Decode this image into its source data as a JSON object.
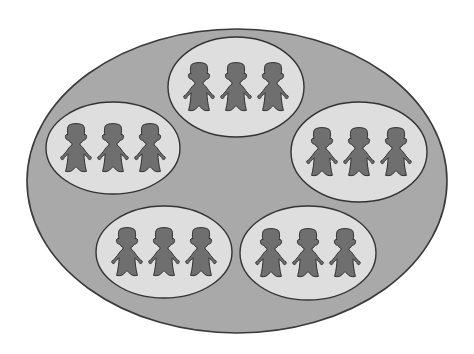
{
  "diagram": {
    "colors": {
      "background": "#ffffff",
      "outer_fill": "#a9a9a9",
      "outer_stroke": "#3a3a3a",
      "group_fill": "#dedede",
      "group_stroke": "#333333",
      "figure_fill": "#6f6f6f",
      "figure_stroke": "#2e2e2e"
    },
    "outer_ellipse": {
      "cx": 237,
      "cy": 181,
      "rx": 210,
      "ry": 152
    },
    "groups": [
      {
        "name": "top",
        "cx": 236,
        "cy": 87,
        "rx": 68,
        "ry": 50,
        "figures": 3
      },
      {
        "name": "left",
        "cx": 113,
        "cy": 148,
        "rx": 67,
        "ry": 46,
        "figures": 3
      },
      {
        "name": "right",
        "cx": 359,
        "cy": 152,
        "rx": 68,
        "ry": 50,
        "figures": 3
      },
      {
        "name": "bottom-left",
        "cx": 164,
        "cy": 252,
        "rx": 68,
        "ry": 46,
        "figures": 3
      },
      {
        "name": "bottom-right",
        "cx": 308,
        "cy": 253,
        "rx": 68,
        "ry": 47,
        "figures": 3
      }
    ],
    "figure": {
      "spacing": 37,
      "width": 32,
      "height": 62
    }
  }
}
